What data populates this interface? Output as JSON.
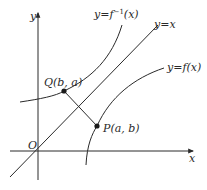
{
  "figure": {
    "axes": {
      "x_label": "x",
      "y_label": "y",
      "origin_label": "O"
    },
    "curves": {
      "inverse": {
        "label_prefix": "y=f",
        "label_sup": "−1",
        "label_suffix": "(x)"
      },
      "identity": {
        "label": "y=x"
      },
      "function": {
        "label": "y=f(x)"
      }
    },
    "points": {
      "Q": {
        "label": "Q(b, a)"
      },
      "P": {
        "label": "P(a, b)"
      }
    },
    "colors": {
      "stroke": "#2a2a2a",
      "background": "#ffffff"
    }
  }
}
